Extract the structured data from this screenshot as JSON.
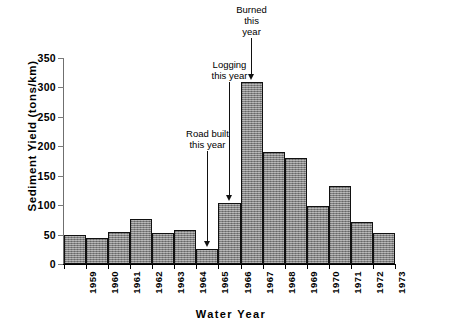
{
  "chart_data": {
    "type": "bar",
    "title": "",
    "xlabel": "Water  Year",
    "ylabel": "Sediment  Yield  (tons/km)",
    "categories": [
      "1959",
      "1960",
      "1961",
      "1962",
      "1963",
      "1964",
      "1965",
      "1966",
      "1967",
      "1968",
      "1969",
      "1970",
      "1971",
      "1972",
      "1973"
    ],
    "values": [
      50,
      45,
      55,
      77,
      52,
      58,
      25,
      104,
      310,
      190,
      180,
      98,
      133,
      72,
      53
    ],
    "ylim": [
      0,
      350
    ],
    "yticks": [
      0,
      50,
      100,
      150,
      200,
      250,
      300,
      350
    ],
    "ytick_labels": [
      "0",
      "50",
      "100",
      "150",
      "200",
      "250",
      "300",
      "350"
    ],
    "grid": false,
    "legend": "none",
    "bar_fill": "#8c8c8c",
    "bar_edge": "#111111",
    "annotations": [
      {
        "label_line1": "Road built",
        "label_line2": "this",
        "label_line3": "year",
        "text": "Road built this year",
        "target_category": "1965"
      },
      {
        "label_line1": "Logging",
        "label_line2": "this year",
        "label_line3": "",
        "text": "Logging this year",
        "target_category": "1966"
      },
      {
        "label_line1": "Burned",
        "label_line2": "this",
        "label_line3": "year",
        "text": "Burned this year",
        "target_category": "1967"
      }
    ]
  },
  "annotation_texts": {
    "burned_l1": "Burned",
    "burned_l2": "this",
    "burned_l3": "year",
    "logging_l1": "Logging",
    "logging_l2": "this  year",
    "road_l1": "Road built",
    "road_l2": "this  year"
  },
  "caption": ""
}
